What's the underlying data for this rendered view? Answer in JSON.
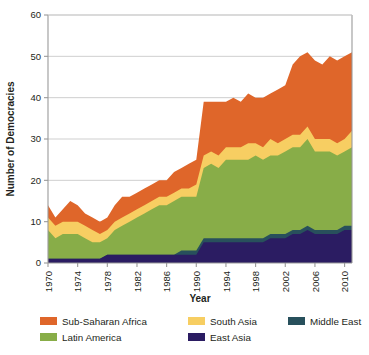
{
  "chart_data": {
    "type": "area",
    "stacked": true,
    "title": "",
    "xlabel": "Year",
    "ylabel": "Number of Democracies",
    "xlim": [
      1970,
      2011
    ],
    "ylim": [
      0,
      60
    ],
    "yticks": [
      0,
      10,
      20,
      30,
      40,
      50,
      60
    ],
    "xticks": [
      1970,
      1974,
      1978,
      1982,
      1986,
      1990,
      1994,
      1998,
      2002,
      2006,
      2010
    ],
    "grid": "horizontal",
    "legend_position": "bottom",
    "x": [
      1970,
      1971,
      1972,
      1973,
      1974,
      1975,
      1976,
      1977,
      1978,
      1979,
      1980,
      1981,
      1982,
      1983,
      1984,
      1985,
      1986,
      1987,
      1988,
      1989,
      1990,
      1991,
      1992,
      1993,
      1994,
      1995,
      1996,
      1997,
      1998,
      1999,
      2000,
      2001,
      2002,
      2003,
      2004,
      2005,
      2006,
      2007,
      2008,
      2009,
      2010,
      2011
    ],
    "stack_order": [
      "East Asia",
      "Middle East",
      "Latin America",
      "South Asia",
      "Sub-Saharan Africa"
    ],
    "series": [
      {
        "name": "East Asia",
        "color": "#2B1C62",
        "values": [
          1,
          1,
          1,
          1,
          1,
          1,
          1,
          1,
          2,
          2,
          2,
          2,
          2,
          2,
          2,
          2,
          2,
          2,
          2,
          2,
          2,
          5,
          5,
          5,
          5,
          5,
          5,
          5,
          5,
          5,
          6,
          6,
          6,
          7,
          7,
          8,
          7,
          7,
          7,
          7,
          8,
          8
        ]
      },
      {
        "name": "Middle East",
        "color": "#28505C",
        "values": [
          0,
          0,
          0,
          0,
          0,
          0,
          0,
          0,
          0,
          0,
          0,
          0,
          0,
          0,
          0,
          0,
          0,
          0,
          1,
          1,
          1,
          1,
          1,
          1,
          1,
          1,
          1,
          1,
          1,
          1,
          1,
          1,
          1,
          1,
          1,
          1,
          1,
          1,
          1,
          1,
          1,
          1
        ]
      },
      {
        "name": "Latin America",
        "color": "#88AD48",
        "values": [
          7,
          5,
          6,
          6,
          6,
          5,
          4,
          4,
          4,
          6,
          7,
          8,
          9,
          10,
          11,
          12,
          12,
          13,
          13,
          13,
          13,
          17,
          18,
          17,
          19,
          19,
          19,
          19,
          20,
          19,
          19,
          19,
          20,
          20,
          20,
          21,
          19,
          19,
          19,
          18,
          18,
          19
        ]
      },
      {
        "name": "South Asia",
        "color": "#F7CE62",
        "values": [
          3,
          3,
          3,
          3,
          3,
          3,
          3,
          2,
          2,
          2,
          2,
          2,
          2,
          2,
          2,
          2,
          2,
          2,
          2,
          2,
          3,
          3,
          3,
          3,
          3,
          3,
          3,
          4,
          3,
          3,
          4,
          3,
          3,
          3,
          3,
          3,
          3,
          3,
          3,
          3,
          3,
          4
        ]
      },
      {
        "name": "Sub-Saharan Africa",
        "color": "#DF662A",
        "values": [
          3,
          2,
          3,
          5,
          4,
          3,
          3,
          3,
          3,
          4,
          5,
          4,
          4,
          4,
          4,
          4,
          4,
          5,
          5,
          6,
          6,
          13,
          12,
          13,
          11,
          12,
          11,
          12,
          11,
          12,
          11,
          13,
          13,
          17,
          19,
          18,
          19,
          18,
          20,
          20,
          20,
          19
        ]
      }
    ],
    "totals": [
      14,
      11,
      13,
      15,
      14,
      12,
      11,
      10,
      11,
      14,
      16,
      16,
      17,
      18,
      19,
      20,
      20,
      22,
      23,
      24,
      25,
      39,
      39,
      39,
      39,
      40,
      39,
      41,
      40,
      40,
      41,
      42,
      43,
      48,
      50,
      51,
      49,
      48,
      50,
      49,
      50,
      51
    ],
    "colors": {
      "sub_saharan_africa": "#DF662A",
      "latin_america": "#88AD48",
      "south_asia": "#F7CE62",
      "east_asia": "#2B1C62",
      "middle_east": "#28505C",
      "gridline": "#c9c9c9",
      "axis": "#9a9a9a",
      "text": "#231f20"
    }
  },
  "axes": {
    "ylabel": "Number of Democracies",
    "xlabel": "Year",
    "ytick_labels": [
      "60",
      "50",
      "40",
      "30",
      "20",
      "10",
      "0"
    ],
    "xtick_labels": [
      "1970",
      "1974",
      "1978",
      "1982",
      "1986",
      "1990",
      "1994",
      "1998",
      "2002",
      "2006",
      "2010"
    ]
  },
  "legend": {
    "items": [
      {
        "label": "Sub-Saharan Africa",
        "color": "#DF662A"
      },
      {
        "label": "Latin America",
        "color": "#88AD48"
      },
      {
        "label": "South Asia",
        "color": "#F7CE62"
      },
      {
        "label": "East Asia",
        "color": "#2B1C62"
      },
      {
        "label": "Middle East",
        "color": "#28505C"
      }
    ]
  }
}
